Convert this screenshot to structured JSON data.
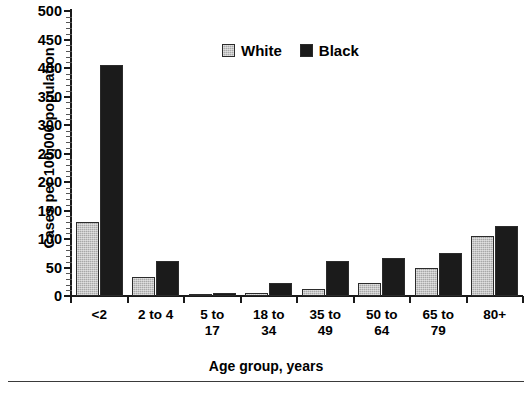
{
  "chart_data": {
    "type": "bar",
    "title": "",
    "xlabel": "Age group, years",
    "ylabel": "Cases per 100,000 population",
    "categories": [
      "<2",
      "2 to 4",
      "5 to\n17",
      "18 to\n34",
      "35 to\n49",
      "50 to\n64",
      "65 to\n79",
      "80+"
    ],
    "series": [
      {
        "name": "White",
        "color": "#a8a8a8",
        "values": [
          130,
          33,
          4,
          5,
          13,
          23,
          50,
          105
        ]
      },
      {
        "name": "Black",
        "color": "#1b1b1b",
        "values": [
          405,
          62,
          6,
          22,
          61,
          66,
          76,
          123
        ]
      }
    ],
    "ylim": [
      0,
      500
    ],
    "ytick_values": [
      0,
      50,
      100,
      150,
      200,
      250,
      300,
      350,
      400,
      450,
      500
    ],
    "ytick_labels": [
      "0",
      "50",
      "100",
      "150",
      "200",
      "250",
      "300",
      "350",
      "400",
      "450",
      "500"
    ],
    "yminor_step": 10,
    "grid": false,
    "legend_position": "top-center"
  },
  "legend": {
    "items": [
      {
        "label": "White",
        "swatch": "white-swatch-icon"
      },
      {
        "label": "Black",
        "swatch": "black-swatch-icon"
      }
    ]
  },
  "axes": {
    "y_title": "Cases per 100,000 population",
    "x_title": "Age group, years"
  }
}
